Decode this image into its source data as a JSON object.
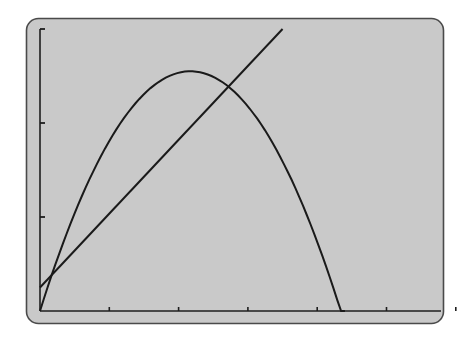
{
  "colors": {
    "page_background": "#ffffff",
    "screen_background": "#c9c9c9",
    "screen_border": "#4a4a4a",
    "axis": "#1e1e1e",
    "curve": "#1a1a1a"
  },
  "chart_data": {
    "type": "line",
    "title": "",
    "xlabel": "",
    "ylabel": "",
    "grid": false,
    "legend": null,
    "tick_labels_shown": false,
    "x_ticks": [
      1,
      2,
      3,
      4,
      5,
      6
    ],
    "y_ticks": [
      1,
      2,
      3
    ],
    "xlim": [
      0,
      5.8
    ],
    "ylim": [
      0,
      3
    ],
    "series": [
      {
        "name": "parabola",
        "shape": "downward parabola through origin",
        "x": [
          0,
          0.5,
          1,
          1.5,
          2,
          2.17,
          2.5,
          3,
          3.5,
          4,
          4.4
        ],
        "y": [
          0,
          1.0,
          1.78,
          2.3,
          2.53,
          2.55,
          2.49,
          2.15,
          1.55,
          0.72,
          0
        ]
      },
      {
        "name": "line",
        "shape": "straight line with positive slope",
        "x": [
          0,
          3.5
        ],
        "y": [
          0.25,
          3.0
        ]
      }
    ],
    "intersections": [
      {
        "x": 0.13,
        "y": 0.35
      },
      {
        "x": 2.7,
        "y": 2.37
      }
    ]
  }
}
